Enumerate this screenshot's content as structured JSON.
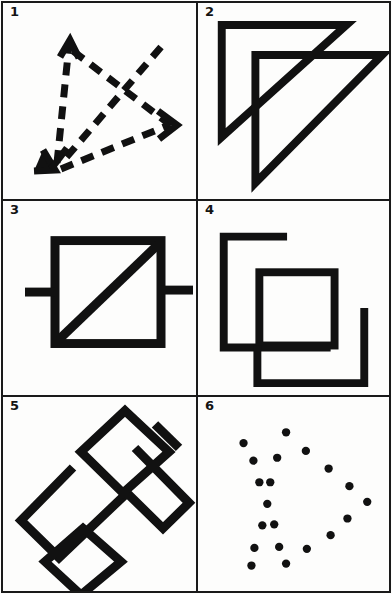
{
  "sheet": {
    "title": "Figure reproduction test sheet",
    "background_color": "#fdfdfc",
    "ink_color": "#111111",
    "border_color": "#1a1a1a",
    "columns": 2,
    "rows": 3
  },
  "panels": [
    {
      "number": "1",
      "figure_name": "dashed-arrow-triangle",
      "description": "Triangle drawn with three dashed arrows plus a dashed diagonal arrow crossing it",
      "style": "dashed",
      "arrow_count": 3
    },
    {
      "number": "2",
      "figure_name": "overlapping-right-triangles",
      "description": "Two overlapping right triangles, each with vertical left leg, horizontal top leg and hypotenuse",
      "style": "solid",
      "shape_count": 2
    },
    {
      "number": "3",
      "figure_name": "square-with-diagonal-and-stubs",
      "description": "Square containing a diagonal from top-right to bottom-left, with short horizontal stubs on left and right sides",
      "style": "solid",
      "shape_count": 1
    },
    {
      "number": "4",
      "figure_name": "interlocking-open-squares",
      "description": "Open bracket shape upper-left, closed square in the middle, open bracket shape lower-right",
      "style": "solid",
      "shape_count": 3
    },
    {
      "number": "5",
      "figure_name": "zigzag-with-two-diamonds",
      "description": "Large rotated zigzag band with two small diamonds overlapping its ends",
      "style": "solid",
      "shape_count": 3
    },
    {
      "number": "6",
      "figure_name": "scattered-dot-pattern",
      "description": "Irregular scattered pattern of filled round dots",
      "style": "dots",
      "dot_count": 21
    }
  ],
  "figure_data": {
    "panel1": {
      "type": "dashed-arrows",
      "dash_pattern": "13 9",
      "stroke_width": 7,
      "arrows": [
        {
          "name": "arrow-up-left",
          "from": [
            52,
            160
          ],
          "to": [
            66,
            38
          ]
        },
        {
          "name": "arrow-down-left",
          "from": [
            66,
            38
          ],
          "to": [
            54,
            163
          ]
        },
        {
          "name": "arrow-diagonal-down-right",
          "from": [
            163,
            42
          ],
          "to": [
            55,
            162
          ]
        },
        {
          "name": "arrow-right-down",
          "from": [
            60,
            168
          ],
          "to": [
            168,
            120
          ]
        },
        {
          "name": "arrow-cross",
          "from": [
            70,
            45
          ],
          "to": [
            170,
            122
          ]
        }
      ]
    },
    "panel2": {
      "type": "triangles",
      "stroke_width": 7,
      "triangles": [
        {
          "name": "triangle-back",
          "points": "28,22 150,22 28,130"
        },
        {
          "name": "triangle-front",
          "points": "62,52 186,52 62,174"
        }
      ]
    },
    "panel3": {
      "type": "square-diagonal",
      "stroke_width": 8,
      "square": {
        "x": 52,
        "y": 36,
        "w": 110,
        "h": 104
      },
      "diagonal": {
        "from": [
          158,
          40
        ],
        "to": [
          56,
          136
        ]
      },
      "stub_left": {
        "from": [
          22,
          88
        ],
        "to": [
          52,
          88
        ]
      },
      "stub_right": {
        "from": [
          162,
          86
        ],
        "to": [
          192,
          86
        ]
      }
    },
    "panel4": {
      "type": "open-squares",
      "stroke_width": 8,
      "shapes": [
        {
          "name": "bracket-upper-left",
          "points": "88,34 28,34 28,144 130,144"
        },
        {
          "name": "square-middle",
          "points": "60,70 134,70 134,142 60,142 60,70"
        },
        {
          "name": "bracket-lower-right",
          "points": "58,142 58,178 166,178 166,106"
        }
      ]
    },
    "panel5": {
      "type": "zigzag-diamonds",
      "stroke_width": 9,
      "zigzag": "68,72 16,124 54,162 122,96 158,132 184,106 130,52",
      "diamond_top": "120,14 164,54 118,96 76,54 120,14",
      "diamond_bottom": "78,132 116,166 76,200 40,166 78,132",
      "tick": {
        "from": [
          150,
          28
        ],
        "to": [
          172,
          50
        ]
      }
    },
    "panel6": {
      "type": "dots",
      "dot_radius": 4.2,
      "dots": [
        [
          89,
          36
        ],
        [
          46,
          47
        ],
        [
          56,
          65
        ],
        [
          80,
          62
        ],
        [
          109,
          55
        ],
        [
          62,
          87
        ],
        [
          73,
          87
        ],
        [
          132,
          73
        ],
        [
          153,
          91
        ],
        [
          70,
          109
        ],
        [
          171,
          107
        ],
        [
          65,
          131
        ],
        [
          77,
          130
        ],
        [
          151,
          124
        ],
        [
          134,
          141
        ],
        [
          57,
          154
        ],
        [
          82,
          153
        ],
        [
          110,
          155
        ],
        [
          54,
          172
        ],
        [
          89,
          170
        ]
      ]
    }
  }
}
